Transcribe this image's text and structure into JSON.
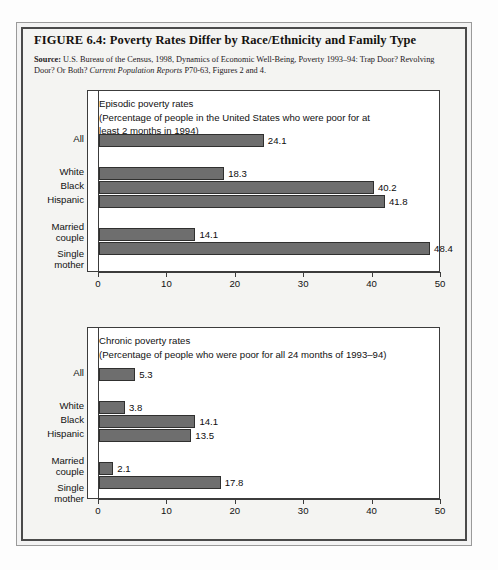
{
  "figure": {
    "title": "FIGURE 6.4:  Poverty Rates Differ by Race/Ethnicity and Family Type",
    "source_label": "Source:",
    "source_line1": " U.S. Bureau of the Census, 1998, Dynamics of Economic Well-Being, Poverty 1993–94: Trap Door? Revolving Door? Or Both? ",
    "source_italic": "Current Population Reports",
    "source_line2": " P70-63, Figures 2 and 4."
  },
  "chart_data": [
    {
      "type": "bar",
      "orientation": "horizontal",
      "title": "Episodic poverty rates",
      "subtitle": "(Percentage of people in the United States who were poor for at least 2 months in 1994)",
      "caption_line1": "Episodic poverty rates",
      "caption_line2": "(Percentage of people in the United States who were poor for at",
      "caption_line3": "least 2 months in 1994)",
      "categories": [
        "All",
        "White",
        "Black",
        "Hispanic",
        "Married couple",
        "Single mother"
      ],
      "category_lines": [
        [
          "All"
        ],
        [
          "White"
        ],
        [
          "Black"
        ],
        [
          "Hispanic"
        ],
        [
          "Married",
          "couple"
        ],
        [
          "Single",
          "mother"
        ]
      ],
      "values": [
        24.1,
        18.3,
        40.2,
        41.8,
        14.1,
        48.4
      ],
      "value_labels": [
        "24.1",
        "18.3",
        "40.2",
        "41.8",
        "14.1",
        "48.4"
      ],
      "xlabel": "",
      "ylabel": "",
      "xlim": [
        0,
        50
      ],
      "xticks": [
        0,
        10,
        20,
        30,
        40,
        50
      ],
      "xtick_labels": [
        "0",
        "10",
        "20",
        "30",
        "40",
        "50"
      ],
      "grid": false,
      "legend": "none",
      "bar_color": "#6e6e6e",
      "bar_edge_color": "#30302f"
    },
    {
      "type": "bar",
      "orientation": "horizontal",
      "title": "Chronic poverty rates",
      "subtitle": "(Percentage of people who were poor for all 24 months of 1993–94)",
      "caption_line1": "Chronic poverty rates",
      "caption_line2": "(Percentage of people who were poor for all 24 months of 1993–94)",
      "caption_line3": "",
      "categories": [
        "All",
        "White",
        "Black",
        "Hispanic",
        "Married couple",
        "Single mother"
      ],
      "category_lines": [
        [
          "All"
        ],
        [
          "White"
        ],
        [
          "Black"
        ],
        [
          "Hispanic"
        ],
        [
          "Married",
          "couple"
        ],
        [
          "Single",
          "mother"
        ]
      ],
      "values": [
        5.3,
        3.8,
        14.1,
        13.5,
        2.1,
        17.8
      ],
      "value_labels": [
        "5.3",
        "3.8",
        "14.1",
        "13.5",
        "2.1",
        "17.8"
      ],
      "xlabel": "",
      "ylabel": "",
      "xlim": [
        0,
        50
      ],
      "xticks": [
        0,
        10,
        20,
        30,
        40,
        50
      ],
      "xtick_labels": [
        "0",
        "10",
        "20",
        "30",
        "40",
        "50"
      ],
      "grid": false,
      "legend": "none",
      "bar_color": "#6e6e6e",
      "bar_edge_color": "#30302f"
    }
  ]
}
